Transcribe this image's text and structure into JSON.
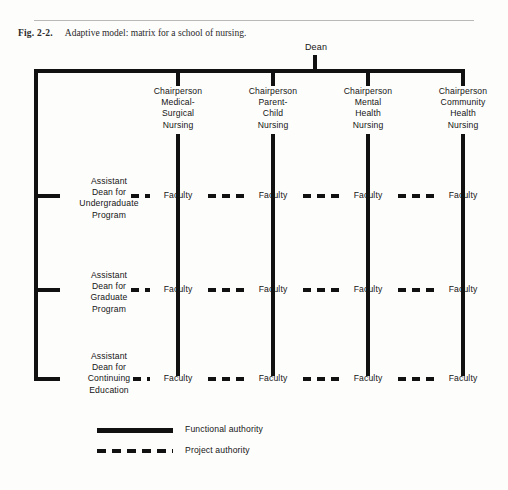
{
  "figure": {
    "number": "Fig. 2-2.",
    "caption": "Adaptive model: matrix for a school of nursing."
  },
  "diagram": {
    "root": {
      "label": "Dean"
    },
    "columns": [
      {
        "label": "Chairperson\nMedical-\nSurgical\nNursing"
      },
      {
        "label": "Chairperson\nParent-\nChild\nNursing"
      },
      {
        "label": "Chairperson\nMental\nHealth\nNursing"
      },
      {
        "label": "Chairperson\nCommunity\nHealth\nNursing"
      }
    ],
    "rows": [
      {
        "label": "Assistant\nDean for\nUndergraduate\nProgram"
      },
      {
        "label": "Assistant\nDean for\nGraduate\nProgram"
      },
      {
        "label": "Assistant\nDean for\nContinuing\nEducation"
      }
    ],
    "cell_label": "Faculty",
    "cells": [
      [
        "Faculty",
        "Faculty",
        "Faculty",
        "Faculty"
      ],
      [
        "Faculty",
        "Faculty",
        "Faculty",
        "Faculty"
      ],
      [
        "Faculty",
        "Faculty",
        "Faculty",
        "Faculty"
      ]
    ]
  },
  "legend": {
    "items": [
      {
        "style": "solid",
        "label": "Functional authority"
      },
      {
        "style": "dashed",
        "label": "Project authority"
      }
    ]
  },
  "colors": {
    "line": "#111111",
    "text": "#151515",
    "rule": "#b9b9b9",
    "background": "#fdfdfc"
  }
}
